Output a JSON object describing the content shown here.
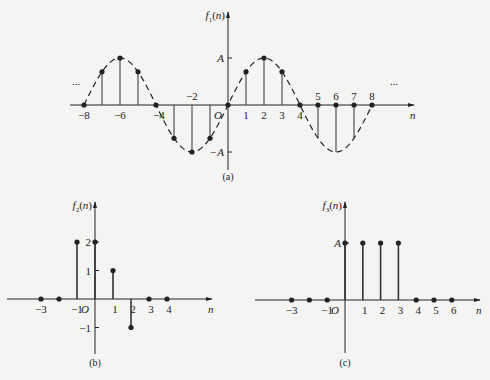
{
  "colors": {
    "background": "#f4f4f2",
    "ink": "#222222",
    "stem": "#333333"
  },
  "chart_data": [
    {
      "id": "a",
      "type": "stem",
      "title": "f1(n)",
      "ylabel": "f1(n)",
      "xlabel": "n",
      "caption": "(a)",
      "origin_label": "O",
      "signal": "A·sin(πn/4)",
      "envelope": "dashed sinusoid",
      "continuation_marks": "...",
      "ytick_labels": [
        "A",
        "-A"
      ],
      "ytick_values": [
        1,
        -1
      ],
      "xtick_labels_below": [
        "-8",
        "-6",
        "-4",
        "1",
        "2",
        "3",
        "4"
      ],
      "xtick_labels_above": [
        "-2",
        "5",
        "6",
        "7",
        "8"
      ],
      "x": [
        -8,
        -7,
        -6,
        -5,
        -4,
        -3,
        -2,
        -1,
        0,
        1,
        2,
        3,
        4,
        5,
        6,
        7,
        8
      ],
      "y": [
        0,
        0.707,
        1,
        0.707,
        0,
        -0.707,
        -1,
        -0.707,
        0,
        0.707,
        1,
        0.707,
        0,
        -0.707,
        -1,
        -0.707,
        0
      ],
      "dots_on_axis_for": [
        5,
        6,
        7
      ],
      "ylim": [
        -1,
        1
      ],
      "xlim": [
        -8,
        8
      ],
      "grid": false
    },
    {
      "id": "b",
      "type": "stem",
      "title": "f2(n)",
      "ylabel": "f2(n)",
      "xlabel": "n",
      "caption": "(b)",
      "origin_label": "O",
      "ytick_labels": [
        "2",
        "1",
        "-1"
      ],
      "ytick_values": [
        2,
        1,
        -1
      ],
      "xtick_labels": [
        "-3",
        "-1",
        "1",
        "2",
        "3",
        "4"
      ],
      "x": [
        -3,
        -2,
        -1,
        0,
        1,
        2,
        3,
        4
      ],
      "y": [
        0,
        0,
        2,
        2,
        1,
        -1,
        0,
        0
      ],
      "ylim": [
        -1,
        2
      ],
      "xlim": [
        -3,
        4
      ],
      "grid": false
    },
    {
      "id": "c",
      "type": "stem",
      "title": "f3(n)",
      "ylabel": "f3(n)",
      "xlabel": "n",
      "caption": "(c)",
      "origin_label": "O",
      "ytick_labels": [
        "A"
      ],
      "ytick_values": [
        1
      ],
      "xtick_labels": [
        "-3",
        "-1",
        "1",
        "2",
        "3",
        "4",
        "5",
        "6"
      ],
      "x": [
        -3,
        -2,
        -1,
        0,
        1,
        2,
        3,
        4,
        5,
        6
      ],
      "y": [
        0,
        0,
        0,
        1,
        1,
        1,
        1,
        0,
        0,
        0
      ],
      "ylim": [
        0,
        1
      ],
      "xlim": [
        -3,
        6
      ],
      "grid": false
    }
  ]
}
